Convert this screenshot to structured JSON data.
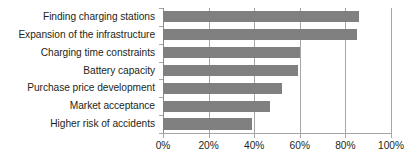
{
  "chart_data": {
    "type": "bar",
    "orientation": "horizontal",
    "title": "",
    "subtitle": "",
    "xlabel": "",
    "ylabel": "",
    "categories": [
      "Finding charging stations",
      "Expansion of the infrastructure",
      "Charging time constraints",
      "Battery capacity",
      "Purchase price development",
      "Market acceptance",
      "Higher risk of accidents"
    ],
    "values": [
      86,
      85,
      60,
      59,
      52,
      47,
      39
    ],
    "value_unit": "%",
    "xlim": [
      0,
      100
    ],
    "xticks": [
      0,
      20,
      40,
      60,
      80,
      100
    ],
    "xtick_labels": [
      "0%",
      "20%",
      "40%",
      "60%",
      "80%",
      "100%"
    ],
    "grid": "vertical",
    "legend": "none",
    "series": [
      {
        "name": "",
        "values": [
          86,
          85,
          60,
          59,
          52,
          47,
          39
        ],
        "color": "#808080"
      }
    ],
    "colors": {
      "bar": "#808080",
      "gridline": "#a6a6a6",
      "axis": "#8c8c8c",
      "text": "#231f20",
      "background": "#ffffff"
    }
  }
}
